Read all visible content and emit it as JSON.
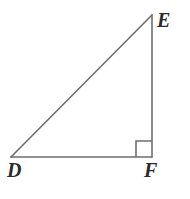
{
  "figure": {
    "kind": "right-triangle-diagram",
    "background_color": "#ffffff",
    "stroke_color": "#6e6e70",
    "label_color": "#2b2b2b",
    "stroke_width": 1.6,
    "canvas": {
      "width": 190,
      "height": 199
    },
    "vertices": [
      {
        "id": "D",
        "label": "D",
        "x": 11,
        "y": 157,
        "angle_marker": false
      },
      {
        "id": "E",
        "label": "E",
        "x": 152,
        "y": 15,
        "angle_marker": false
      },
      {
        "id": "F",
        "label": "F",
        "x": 152,
        "y": 157,
        "angle_marker": true
      }
    ],
    "edges": [
      {
        "id": "DE",
        "from": "D",
        "to": "E",
        "role": "hypotenuse"
      },
      {
        "id": "EF",
        "from": "E",
        "to": "F",
        "role": "vertical-leg"
      },
      {
        "id": "DF",
        "from": "D",
        "to": "F",
        "role": "horizontal-leg"
      }
    ],
    "right_angle": {
      "at_vertex": "F",
      "marker": "square",
      "x": 136,
      "y": 141,
      "size": 16
    },
    "labels": {
      "E": {
        "text": "E",
        "x": 157,
        "y": 10
      },
      "D": {
        "text": "D",
        "x": 7,
        "y": 160
      },
      "F": {
        "text": "F",
        "x": 144,
        "y": 160
      }
    }
  }
}
